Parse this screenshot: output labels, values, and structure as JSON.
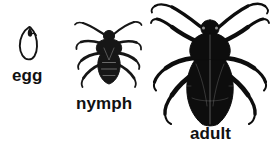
{
  "figure": {
    "background_color": "#ffffff",
    "ink_color": "#111111",
    "width": 274,
    "height": 148
  },
  "stages": [
    {
      "key": "egg",
      "label": "egg",
      "icon": "insect-egg-illustration",
      "description": "small outlined oval egg",
      "relative_size": "smallest"
    },
    {
      "key": "nymph",
      "label": "nymph",
      "icon": "insect-nymph-illustration",
      "description": "dark immature true bug with antennae and six legs",
      "relative_size": "medium"
    },
    {
      "key": "adult",
      "label": "adult",
      "icon": "insect-adult-illustration",
      "description": "large dark adult true bug with folded wings, long antennae and six legs",
      "relative_size": "largest"
    }
  ]
}
